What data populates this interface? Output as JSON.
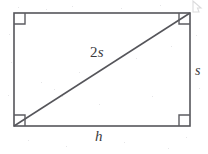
{
  "figure": {
    "kind": "right-triangle-inscribed-in-rectangle",
    "background_color": "#ffffff",
    "stroke_color": "#55555a",
    "label_color": "#3a3a3c",
    "stroke_width": 1.6,
    "rectangle": {
      "left": 14,
      "top": 13,
      "right": 190,
      "bottom": 126,
      "width": 176,
      "height": 113
    },
    "diagonal": {
      "from": {
        "x": 14,
        "y": 126
      },
      "to": {
        "x": 190,
        "y": 13
      }
    },
    "right_angle_marks": [
      {
        "name": "top-left",
        "x": 14,
        "y": 13,
        "size": 11
      },
      {
        "name": "top-right",
        "x": 190,
        "y": 13,
        "size": 11
      },
      {
        "name": "bottom-left",
        "x": 14,
        "y": 126,
        "size": 11
      },
      {
        "name": "bottom-right",
        "x": 190,
        "y": 126,
        "size": 11
      }
    ],
    "labels": {
      "diagonal_coefficient": "2",
      "diagonal_variable": "s",
      "diagonal_full": "2s",
      "vertical_side": "s",
      "horizontal_side": "h"
    }
  }
}
